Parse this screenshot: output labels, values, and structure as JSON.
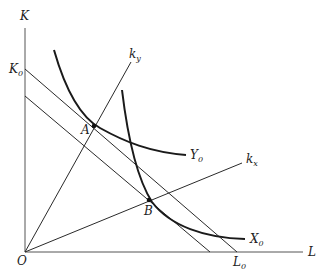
{
  "diagram": {
    "axes": {
      "y_label": "K",
      "x_label": "L",
      "origin_label": "O"
    },
    "intercepts": {
      "k0": {
        "main": "K",
        "sub": "0"
      },
      "l0": {
        "main": "L",
        "sub": "0"
      }
    },
    "rays": {
      "ky": {
        "main": "k",
        "sub": "y"
      },
      "kx": {
        "main": "k",
        "sub": "x"
      }
    },
    "isoquants": {
      "y0": {
        "main": "Y",
        "sub": "0"
      },
      "x0": {
        "main": "X",
        "sub": "0"
      }
    },
    "points": {
      "a": "A",
      "b": "B"
    },
    "colors": {
      "line": "#2a2a2a",
      "curve": "#1a1a1a",
      "axis": "#555555"
    }
  }
}
